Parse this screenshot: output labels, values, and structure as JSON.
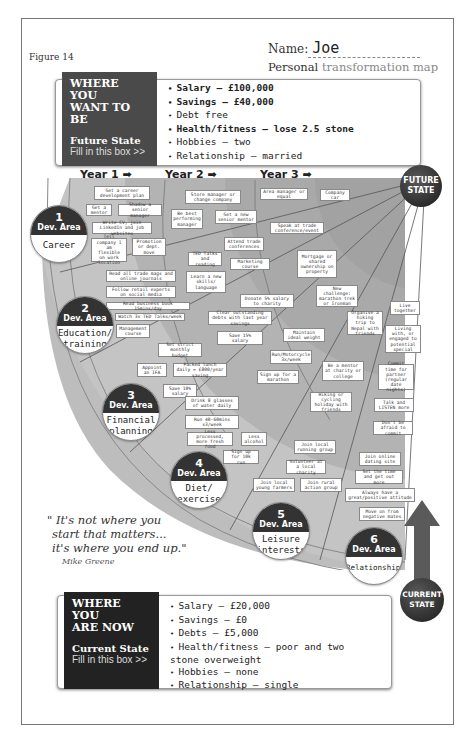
{
  "figure_label": "Figure 14",
  "header": {
    "name_label": "Name:",
    "name_value": "Joe",
    "title_bold": "Personal",
    "title_light": "transformation map"
  },
  "future_box": {
    "heading_line1": "WHERE YOU",
    "heading_line2": "WANT TO BE",
    "state_label": "Future State",
    "fill_prompt": "Fill in this box >>",
    "items": [
      {
        "text": "Salary – £100,000",
        "bold": true
      },
      {
        "text": "Savings – £40,000",
        "bold": true
      },
      {
        "text": "Debt free",
        "bold": false
      },
      {
        "text": "Health/fitness – lose 2.5 stone",
        "bold": true
      },
      {
        "text": "Hobbies – two",
        "bold": false
      },
      {
        "text": "Relationship – married",
        "bold": false
      }
    ]
  },
  "current_box": {
    "heading_line1": "WHERE YOU",
    "heading_line2": "ARE NOW",
    "state_label": "Current State",
    "fill_prompt": "Fill in this box >>",
    "items": [
      {
        "text": "Salary – £20,000"
      },
      {
        "text": "Savings – £0"
      },
      {
        "text": "Debts – £5,000"
      },
      {
        "text": "Health/fitness – poor and two stone overweight"
      },
      {
        "text": "Hobbies – none"
      },
      {
        "text": "Relationship – single"
      }
    ]
  },
  "years": [
    "Year 1 ➡",
    "Year 2 ➡",
    "Year 3 ➡"
  ],
  "future_state_label": [
    "FUTURE",
    "STATE"
  ],
  "current_state_label": [
    "CURRENT",
    "STATE"
  ],
  "dev_areas": [
    {
      "num": "1",
      "label": "Dev. Area",
      "name": "Career"
    },
    {
      "num": "2",
      "label": "Dev. Area",
      "name": "Education/ training"
    },
    {
      "num": "3",
      "label": "Dev. Area",
      "name": "Financial planning"
    },
    {
      "num": "4",
      "label": "Dev. Area",
      "name": "Diet/ exercise"
    },
    {
      "num": "5",
      "label": "Dev. Area",
      "name": "Leisure interests"
    },
    {
      "num": "6",
      "label": "Dev. Area",
      "name": "Relationships"
    }
  ],
  "notes": {
    "career": [
      "Get a career development plan",
      "Get a mentor",
      "Shadow a senior manager",
      "Write CV, join LinkedIn and job websites",
      "Tell company I am flexible on work location",
      "Promotion or dept. move",
      "Store manager or change company",
      "Be best performing manager",
      "Get a new senior mentor",
      "Area manager or equal",
      "Company car"
    ],
    "education": [
      "Read all trade mags and online journals",
      "Follow retail experts on social media",
      "Read business book 15mins/day",
      "Watch 3x TED Talks/week",
      "Management course",
      "TED Talks and reading",
      "Attend trade conferences",
      "Marketing course",
      "Learn a new skills/ language",
      "Speak at trade conference/event"
    ],
    "financial": [
      "Set strict monthly budget",
      "Appoint an IFA",
      "Packed lunch daily = £800/year saving",
      "Save 10% salary",
      "Clear outstanding debts with last year savings",
      "Save 15% salary",
      "Donate 5% salary to charity",
      "Mortgage or shared ownership on property"
    ],
    "diet": [
      "Drink 8 glasses of water daily",
      "Run 40-60mins x3/week",
      "Less processed, more fresh food",
      "Less alcohol",
      "Sign up for 10k run",
      "Run/Motorcycle 3x/week",
      "Sign up for a marathon",
      "Maintain ideal weight",
      "New challenge: marathon trek or Ironman"
    ],
    "leisure": [
      "Join local running group",
      "Volunteer at a local charity",
      "Join local young farmers",
      "Join rural action group",
      "Hiking or cycling holiday with friends",
      "Be a mentor at charity or college",
      "Organise a hiking trip to Nepal with friends"
    ],
    "relationships": [
      "Live together",
      "Living with, or engaged to potential special",
      "Commit time for partner (regular date nights)",
      "Talk and LISTEN more",
      "Don't be afraid to commit",
      "Join online dating site",
      "Set the time and get out more",
      "Always have a great/positive attitude",
      "Move on from negative mates"
    ]
  },
  "quote": {
    "line1": "\" It's not where you",
    "line2": "start that matters...",
    "line3": "it's where you end up.\"",
    "author": "Mike Greene"
  }
}
